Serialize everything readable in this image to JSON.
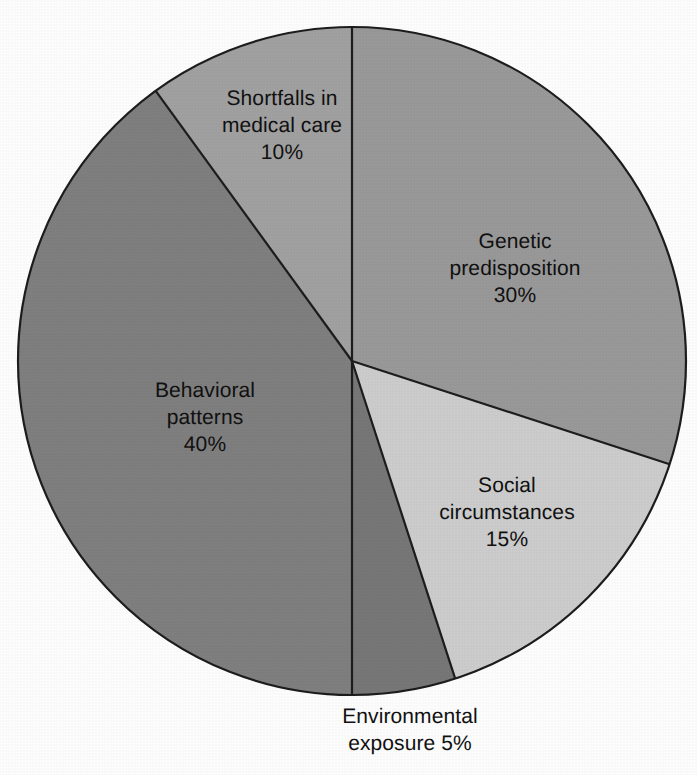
{
  "chart_data": {
    "type": "pie",
    "title": "",
    "subtitle": "",
    "xlabel": "",
    "ylabel": "",
    "legend_position": "none",
    "grid": false,
    "start_angle_deg": 0,
    "direction": "clockwise",
    "categories": [
      "Genetic predisposition",
      "Social circumstances",
      "Environmental exposure",
      "Behavioral patterns",
      "Shortfalls in medical care"
    ],
    "values": [
      30,
      15,
      5,
      40,
      10
    ],
    "value_labels": [
      "30%",
      "15%",
      "5%",
      "40%",
      "10%"
    ],
    "units": "%",
    "slices": [
      {
        "name": "Genetic predisposition",
        "label_line1": "Genetic",
        "label_line2": "predisposition",
        "value": 30,
        "value_label": "30%",
        "color": "#9a9a9a",
        "start_deg": 0,
        "end_deg": 108,
        "label_placement": "inside"
      },
      {
        "name": "Social circumstances",
        "label_line1": "Social",
        "label_line2": "circumstances",
        "value": 15,
        "value_label": "15%",
        "color": "#cecece",
        "start_deg": 108,
        "end_deg": 162,
        "label_placement": "inside"
      },
      {
        "name": "Environmental exposure",
        "label_line1": "Environmental",
        "label_line2": "exposure 5%",
        "value": 5,
        "value_label": "5%",
        "color": "#787878",
        "start_deg": 162,
        "end_deg": 180,
        "label_placement": "outside-bottom"
      },
      {
        "name": "Behavioral patterns",
        "label_line1": "Behavioral",
        "label_line2": "patterns",
        "value": 40,
        "value_label": "40%",
        "color": "#808080",
        "start_deg": 180,
        "end_deg": 324,
        "label_placement": "inside"
      },
      {
        "name": "Shortfalls in medical care",
        "label_line1": "Shortfalls in",
        "label_line2": "medical care",
        "value": 10,
        "value_label": "10%",
        "color": "#a2a2a2",
        "start_deg": 324,
        "end_deg": 360,
        "label_placement": "inside"
      }
    ],
    "geometry": {
      "center_x": 352,
      "center_y": 361,
      "radius": 334
    },
    "style": {
      "background": "#ffffff",
      "outline_color": "#1d1d1d",
      "separator_color": "#1d1d1d",
      "label_text_color": "#111111"
    }
  },
  "labels": {
    "genetic": "Genetic\npredisposition\n30%",
    "social": "Social\ncircumstances\n15%",
    "behavioral": "Behavioral\npatterns\n40%",
    "shortfalls": "Shortfalls in\nmedical care\n10%",
    "environmental": "Environmental\nexposure 5%"
  }
}
